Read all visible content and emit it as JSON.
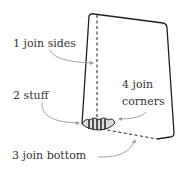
{
  "diagram": {
    "labels": [
      {
        "id": "join-sides",
        "text": "1 join sides"
      },
      {
        "id": "stuff",
        "text": "2 stuff"
      },
      {
        "id": "join-bottom",
        "text": "3 join bottom"
      },
      {
        "id": "join-corners-1",
        "text": "4 join"
      },
      {
        "id": "join-corners-2",
        "text": "corners"
      }
    ],
    "colors": {
      "ink": "#222222",
      "arrow": "#999999",
      "text": "#333333"
    }
  }
}
